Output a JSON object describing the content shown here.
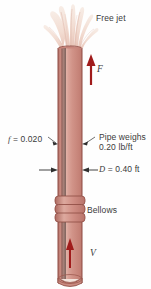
{
  "figure": {
    "labels": {
      "free_jet": "Free jet",
      "friction_factor": "f = 0.020",
      "pipe_weight": "Pipe weighs 0.20 lb/ft",
      "pipe_weight_line1": "Pipe weighs",
      "pipe_weight_line2": "0.20 lb/ft",
      "diameter": "D = 0.40 ft",
      "bellows": "Bellows",
      "force": "F",
      "velocity": "V"
    },
    "values": {
      "friction_factor_symbol": "f",
      "friction_factor_value": "0.020",
      "diameter_symbol": "D",
      "diameter_value": "0.40 ft",
      "weight_per_length": "0.20 lb/ft"
    },
    "colors": {
      "pipe_fill": "#cf8d84",
      "pipe_light": "#e3b0a6",
      "pipe_dark": "#b26f67",
      "pipe_outline": "#8e4b43",
      "arrow_red": "#a01b1b",
      "jet_pale": "#f0ded3",
      "label_text": "#3b3b3b",
      "leader_line": "#4a4a4a",
      "background": "#fefefe"
    },
    "icons": {
      "force_arrow": "up-arrow-icon",
      "velocity_arrow": "up-arrow-icon",
      "diameter_arrows": "dimension-arrow-icon"
    }
  }
}
